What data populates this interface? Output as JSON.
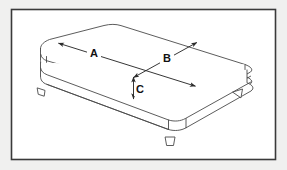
{
  "diagram": {
    "border_color": "#3a3a3a",
    "line_color": "#4a4a4a",
    "fill_color": "#ffffff",
    "page_background": "#f0f0ef",
    "panel_background": "#ffffff",
    "dimensions": [
      {
        "key": "A",
        "label": "A",
        "meaning": "length",
        "label_x": 94,
        "label_y": 56,
        "arrow": "double"
      },
      {
        "key": "B",
        "label": "B",
        "meaning": "width",
        "label_x": 167,
        "label_y": 61,
        "arrow": "double"
      },
      {
        "key": "C",
        "label": "C",
        "meaning": "height",
        "label_x": 140,
        "label_y": 92,
        "arrow": "double"
      }
    ],
    "legs": [
      {
        "name": "leg-front-left",
        "x": 41,
        "y": 92
      },
      {
        "name": "leg-front-center",
        "x": 170,
        "y": 142
      },
      {
        "name": "leg-right",
        "x": 238,
        "y": 95
      }
    ]
  }
}
